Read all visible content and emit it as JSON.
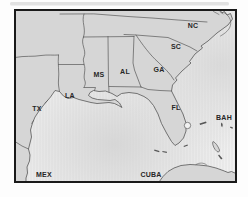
{
  "map": {
    "region_labels": [
      {
        "id": "tx",
        "text": "TX"
      },
      {
        "id": "la",
        "text": "LA"
      },
      {
        "id": "ms",
        "text": "MS"
      },
      {
        "id": "al",
        "text": "AL"
      },
      {
        "id": "ga",
        "text": "GA"
      },
      {
        "id": "sc",
        "text": "SC"
      },
      {
        "id": "nc",
        "text": "NC"
      },
      {
        "id": "fl",
        "text": "FL"
      },
      {
        "id": "bah",
        "text": "BAH"
      },
      {
        "id": "mex",
        "text": "MEX"
      },
      {
        "id": "cuba",
        "text": "CUBA"
      }
    ],
    "colors": {
      "land": "#d6d6d6",
      "water": "#f1f1f1",
      "shade": "#d9d9d9",
      "border": "#575757",
      "frame": "#1a1a1a",
      "label": "#262626"
    }
  }
}
